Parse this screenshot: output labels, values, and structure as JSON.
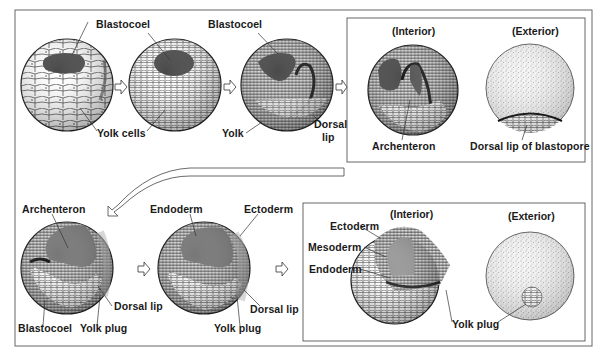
{
  "figure": {
    "colors": {
      "line": "#444444",
      "cavity": "#555555",
      "stipple": "#9a9a9a",
      "cell_fill": "#ffffff"
    }
  },
  "stages": [
    {
      "id": "stage-1",
      "labels": {
        "blastocoel": "Blastocoel",
        "yolk_cells": "Yolk cells"
      }
    },
    {
      "id": "stage-2",
      "labels": {}
    },
    {
      "id": "stage-3",
      "labels": {
        "blastocoel": "Blastocoel",
        "yolk": "Yolk",
        "dorsal_lip": "Dorsal",
        "dorsal_lip_2": "lip"
      }
    },
    {
      "id": "stage-4",
      "panel": {
        "interior_header": "(Interior)",
        "exterior_header": "(Exterior)"
      },
      "labels": {
        "archenteron": "Archenteron",
        "dorsal_lip_blastopore": "Dorsal lip of blastopore"
      }
    },
    {
      "id": "stage-5",
      "labels": {
        "archenteron": "Archenteron",
        "dorsal_lip": "Dorsal lip",
        "blastocoel": "Blastocoel",
        "yolk_plug": "Yolk plug"
      }
    },
    {
      "id": "stage-6",
      "labels": {
        "endoderm": "Endoderm",
        "ectoderm": "Ectoderm",
        "dorsal_lip": "Dorsal lip",
        "yolk_plug": "Yolk plug"
      }
    },
    {
      "id": "stage-7",
      "panel": {
        "interior_header": "(Interior)",
        "exterior_header": "(Exterior)"
      },
      "labels": {
        "ectoderm": "Ectoderm",
        "mesoderm": "Mesoderm",
        "endoderm": "Endoderm",
        "yolk_plug": "Yolk plug"
      }
    }
  ],
  "arrows": [
    {
      "from": "stage-1",
      "to": "stage-2",
      "icon": "right-arrow-icon"
    },
    {
      "from": "stage-2",
      "to": "stage-3",
      "icon": "right-arrow-icon"
    },
    {
      "from": "stage-3",
      "to": "stage-4",
      "icon": "right-arrow-icon"
    },
    {
      "from": "stage-4",
      "to": "stage-5",
      "icon": "curved-arrow-icon"
    },
    {
      "from": "stage-5",
      "to": "stage-6",
      "icon": "right-arrow-icon"
    },
    {
      "from": "stage-6",
      "to": "stage-7",
      "icon": "right-arrow-icon"
    }
  ]
}
